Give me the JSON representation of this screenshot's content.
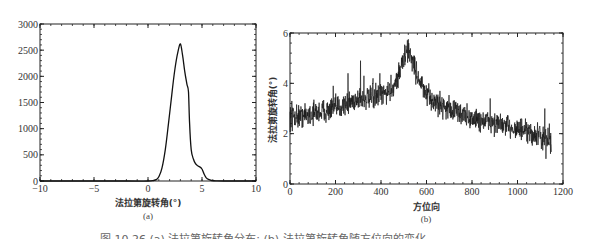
{
  "caption": "图 10.26  (a) 法拉第旋转角分布; (b) 法拉第旋转角随方位向的变化",
  "chart_data": [
    {
      "id": "a",
      "type": "line",
      "subtitle": "(a)",
      "xlabel": "法拉第旋转角(°)",
      "ylabel": "",
      "xlim": [
        -10,
        10
      ],
      "ylim": [
        0,
        3000
      ],
      "xticks": [
        -10,
        -5,
        0,
        5,
        10
      ],
      "yticks": [
        0,
        500,
        1000,
        1500,
        2000,
        2500,
        3000
      ],
      "grid": false,
      "x": [
        -10,
        -2,
        0,
        0.5,
        0.8,
        1.0,
        1.3,
        1.6,
        1.9,
        2.2,
        2.5,
        2.75,
        3.0,
        3.2,
        3.4,
        3.6,
        3.75,
        3.85,
        4.0,
        4.2,
        4.4,
        4.6,
        4.8,
        5.0,
        5.2,
        5.4,
        5.6,
        5.9,
        6.3,
        7,
        10
      ],
      "values": [
        0,
        0,
        0,
        10,
        30,
        80,
        250,
        600,
        1100,
        1650,
        2150,
        2450,
        2620,
        2400,
        2100,
        1850,
        1700,
        1100,
        600,
        420,
        330,
        290,
        270,
        230,
        130,
        60,
        30,
        10,
        3,
        0,
        0
      ]
    },
    {
      "id": "b",
      "type": "line",
      "subtitle": "(b)",
      "xlabel": "方位向",
      "ylabel": "法拉第旋转角(°)",
      "xlim": [
        0,
        1200
      ],
      "ylim": [
        0,
        6
      ],
      "xticks": [
        0,
        200,
        400,
        600,
        800,
        1000,
        1200
      ],
      "yticks": [
        0,
        2,
        4,
        6
      ],
      "grid": false,
      "trend_x": [
        0,
        50,
        100,
        150,
        200,
        250,
        300,
        350,
        400,
        450,
        480,
        500,
        520,
        540,
        560,
        580,
        600,
        650,
        700,
        750,
        800,
        850,
        900,
        950,
        1000,
        1050,
        1100,
        1150
      ],
      "trend_y": [
        2.7,
        2.7,
        2.8,
        2.9,
        3.0,
        3.2,
        3.4,
        3.4,
        3.5,
        3.8,
        4.4,
        5.0,
        5.3,
        4.9,
        4.3,
        3.9,
        3.5,
        3.2,
        3.0,
        2.8,
        2.6,
        2.5,
        2.4,
        2.3,
        2.2,
        2.0,
        1.9,
        1.7
      ],
      "noise_amplitude": 0.35,
      "spikes": [
        {
          "x": 8,
          "y": 3.3
        },
        {
          "x": 10,
          "y": 2.1
        },
        {
          "x": 190,
          "y": 3.9
        },
        {
          "x": 255,
          "y": 4.4
        },
        {
          "x": 310,
          "y": 4.9
        },
        {
          "x": 325,
          "y": 4.3
        },
        {
          "x": 365,
          "y": 4.2
        },
        {
          "x": 395,
          "y": 4.4
        },
        {
          "x": 520,
          "y": 5.75
        },
        {
          "x": 880,
          "y": 3.4
        },
        {
          "x": 1120,
          "y": 3.0
        },
        {
          "x": 1125,
          "y": 1.0
        },
        {
          "x": 1140,
          "y": 2.4
        },
        {
          "x": 1145,
          "y": 1.2
        }
      ],
      "n_samples": 1150
    }
  ]
}
